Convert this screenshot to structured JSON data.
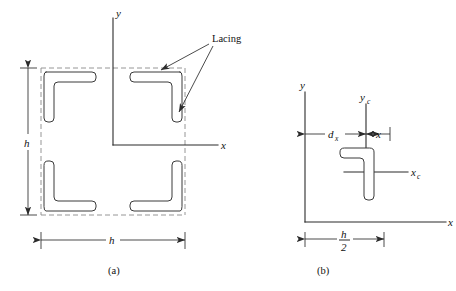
{
  "figure": {
    "kind": "engineering-cross-section-diagram",
    "panels": [
      {
        "id": "a",
        "caption": "(a)",
        "axes": [
          {
            "name": "y-axis",
            "label": "y",
            "orientation": "vertical"
          },
          {
            "name": "x-axis",
            "label": "x",
            "orientation": "horizontal"
          }
        ],
        "dimensions": [
          {
            "name": "height-dimension",
            "label": "h",
            "orientation": "vertical"
          },
          {
            "name": "width-dimension",
            "label": "h",
            "orientation": "horizontal"
          }
        ],
        "annotations": [
          {
            "name": "lacing-callout",
            "label": "Lacing",
            "arrows": 2
          }
        ],
        "members": [
          {
            "name": "angle-top-left",
            "position": "top-left"
          },
          {
            "name": "angle-top-right",
            "position": "top-right"
          },
          {
            "name": "angle-bottom-left",
            "position": "bottom-left"
          },
          {
            "name": "angle-bottom-right",
            "position": "bottom-right"
          }
        ],
        "lacing_outline": "dashed square connecting the four angle backs"
      },
      {
        "id": "b",
        "caption": "(b)",
        "axes": [
          {
            "name": "y-axis",
            "label": "y",
            "orientation": "vertical"
          },
          {
            "name": "x-axis",
            "label": "x",
            "orientation": "horizontal"
          },
          {
            "name": "yc-axis",
            "label": "y",
            "subscript": "c",
            "orientation": "vertical"
          },
          {
            "name": "xc-axis",
            "label": "x",
            "subscript": "c",
            "orientation": "horizontal"
          }
        ],
        "dimensions": [
          {
            "name": "dx-dimension",
            "label": "d",
            "subscript": "x",
            "orientation": "horizontal"
          },
          {
            "name": "x-offset-dimension",
            "label": "x",
            "orientation": "horizontal"
          },
          {
            "name": "half-width-dimension",
            "label_numerator": "h",
            "label_denominator": "2",
            "orientation": "horizontal"
          }
        ],
        "members": [
          {
            "name": "angle-detail",
            "position": "centroid-detail"
          }
        ]
      }
    ]
  },
  "colors": {
    "ink": "#2b2b2b",
    "dashed_gray": "#8a8a8a",
    "background": "#ffffff",
    "shape_stroke": "#3a3a3a"
  }
}
